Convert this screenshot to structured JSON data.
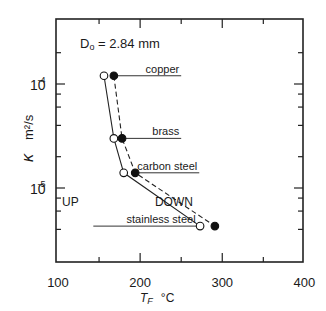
{
  "chart_data": {
    "type": "line",
    "title": "",
    "annotation": "Dₒ = 2.84 mm",
    "annotation_parts": {
      "symbol": "D",
      "subscript": "o",
      "rest": " = 2.84 mm"
    },
    "xlabel": "T_F  °C",
    "xlabel_parts": {
      "symbol": "T",
      "subscript": "F",
      "unit": "°C"
    },
    "ylabel": "κ  m²/s",
    "ylabel_parts": {
      "symbol": "κ",
      "unit": "m²/s"
    },
    "xlim": [
      100,
      400
    ],
    "ylim": [
      2e-06,
      0.00042
    ],
    "yscale": "log",
    "x_ticks": [
      100,
      200,
      300,
      400
    ],
    "x_tick_labels": [
      "100",
      "200",
      "300",
      "400"
    ],
    "x_minor_ticks": [
      150,
      250,
      350
    ],
    "y_major_ticks": [
      0.0001,
      1e-05
    ],
    "y_tick_labels": [
      {
        "base": "10",
        "exp": "-4"
      },
      {
        "base": "10",
        "exp": "-5"
      }
    ],
    "y_minor_ticks": [
      0.0002,
      8e-05,
      6e-05,
      4e-05,
      2e-05,
      8e-06,
      6e-06,
      4e-06
    ],
    "grid": false,
    "materials": [
      "copper",
      "brass",
      "carbon steel",
      "stainless steel"
    ],
    "series": [
      {
        "name": "UP",
        "marker": "open-circle",
        "line": "solid",
        "x": [
          156,
          168,
          180,
          273
        ],
        "y": [
          0.00012,
          3e-05,
          1.4e-05,
          4.3e-06
        ]
      },
      {
        "name": "DOWN",
        "marker": "filled-circle",
        "line": "dashed",
        "x": [
          168,
          178,
          194,
          291
        ],
        "y": [
          0.00012,
          3e-05,
          1.4e-05,
          4.3e-06
        ]
      }
    ],
    "series_labels": [
      {
        "text": "UP",
        "x": 105,
        "y": 7.5e-06
      },
      {
        "text": "DOWN",
        "x": 218,
        "y": 7.5e-06
      }
    ],
    "material_labels": [
      {
        "text": "copper",
        "x_start": 172,
        "x_end": 250,
        "y": 0.00012
      },
      {
        "text": "brass",
        "x_start": 182,
        "x_end": 250,
        "y": 3e-05
      },
      {
        "text": "carbon steel",
        "x_start": 198,
        "x_end": 272,
        "y": 1.4e-05
      },
      {
        "text": "stainless steel",
        "x_start": 143,
        "x_end": 270,
        "y": 4.3e-06
      }
    ]
  }
}
